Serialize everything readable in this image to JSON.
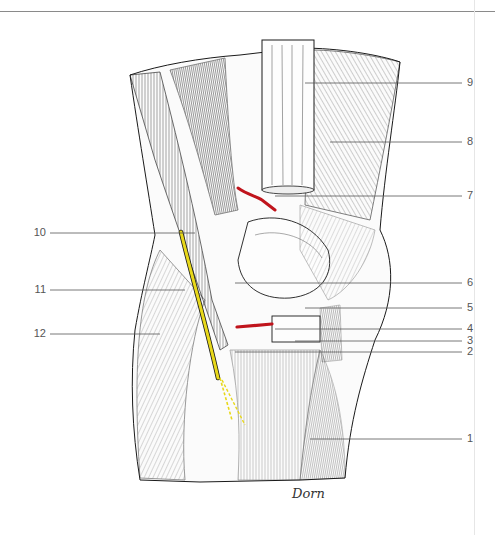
{
  "figure": {
    "signature": "Dorn",
    "colors": {
      "artery": "#c0141c",
      "nerve": "#e8d81a",
      "ink": "#1a1a1a",
      "leader": "#555555"
    },
    "labels_right": [
      {
        "num": "9",
        "y": 83
      },
      {
        "num": "8",
        "y": 142
      },
      {
        "num": "7",
        "y": 196
      },
      {
        "num": "6",
        "y": 283
      },
      {
        "num": "5",
        "y": 308
      },
      {
        "num": "4",
        "y": 329
      },
      {
        "num": "3",
        "y": 341
      },
      {
        "num": "2",
        "y": 352
      },
      {
        "num": "1",
        "y": 439
      }
    ],
    "labels_left": [
      {
        "num": "10",
        "y": 233
      },
      {
        "num": "11",
        "y": 290
      },
      {
        "num": "12",
        "y": 334
      }
    ]
  }
}
